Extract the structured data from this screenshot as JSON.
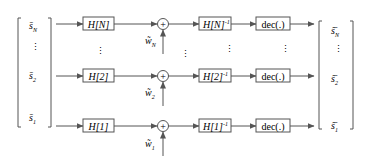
{
  "diagram": {
    "type": "block-diagram",
    "colors": {
      "stroke": "#555555",
      "text": "#3a3a3a",
      "background": "#ffffff"
    },
    "input_vector": {
      "entries": [
        {
          "base": "s̄",
          "sub": "N"
        },
        {
          "base": "⋮",
          "sub": ""
        },
        {
          "base": "s̄",
          "sub": "2"
        },
        {
          "base": "s̄",
          "sub": "1"
        }
      ]
    },
    "output_vector": {
      "entries": [
        {
          "base": "ŝ̄",
          "sub": "N"
        },
        {
          "base": "⋮",
          "sub": ""
        },
        {
          "base": "ŝ̄",
          "sub": "2"
        },
        {
          "base": "ŝ̄",
          "sub": "1"
        }
      ]
    },
    "rows": [
      {
        "index": "N",
        "channel": "H[N]",
        "adder_symbol": "+",
        "noise": {
          "base": "w̃",
          "sub": "N"
        },
        "inverse": "H[N]",
        "inverse_sup": "-1",
        "decoder": "dec(.)"
      },
      {
        "index": "2",
        "channel": "H[2]",
        "adder_symbol": "+",
        "noise": {
          "base": "w̃",
          "sub": "2"
        },
        "inverse": "H[2]",
        "inverse_sup": "-1",
        "decoder": "dec(.)"
      },
      {
        "index": "1",
        "channel": "H[1]",
        "adder_symbol": "+",
        "noise": {
          "base": "w̃",
          "sub": "1"
        },
        "inverse": "H[1]",
        "inverse_sup": "-1",
        "decoder": "dec(.)"
      }
    ],
    "ellipsis": "⋮"
  }
}
